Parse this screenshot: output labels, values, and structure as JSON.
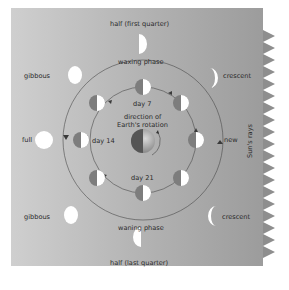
{
  "colors": {
    "background_light": "#c9c9c9",
    "background_dark": "#9a9a9a",
    "moon_lit": "#ffffff",
    "moon_dark": "#7d7d7d",
    "orbit_line": "#4a4a4a",
    "sun_rays": "#8a8a8a",
    "text": "#2a2a2a"
  },
  "labels": {
    "top": "half (first quarter)",
    "bottom": "half (last quarter)",
    "upper_left": "gibbous",
    "upper_right": "crescent",
    "lower_left": "gibbous",
    "lower_right": "crescent",
    "left": "full",
    "right": "new",
    "waxing": "waxing phase",
    "waning": "waning phase",
    "day7": "day 7",
    "day14": "day 14",
    "day21": "day 21",
    "center_line1": "direction of",
    "center_line2": "Earth's rotation",
    "sun_rays": "Sun's rays"
  },
  "outer_phases": [
    {
      "name": "half (first quarter)",
      "position": "top",
      "lit_side": "right"
    },
    {
      "name": "crescent",
      "position": "upper-right",
      "lit_side": "right"
    },
    {
      "name": "new",
      "position": "right",
      "lit_side": "none"
    },
    {
      "name": "crescent",
      "position": "lower-right",
      "lit_side": "left"
    },
    {
      "name": "half (last quarter)",
      "position": "bottom",
      "lit_side": "left"
    },
    {
      "name": "gibbous",
      "position": "lower-left",
      "lit_side": "mostly"
    },
    {
      "name": "full",
      "position": "left",
      "lit_side": "all"
    },
    {
      "name": "gibbous",
      "position": "upper-left",
      "lit_side": "mostly"
    }
  ],
  "orbit_days": [
    "day 7",
    "day 14",
    "day 21"
  ]
}
